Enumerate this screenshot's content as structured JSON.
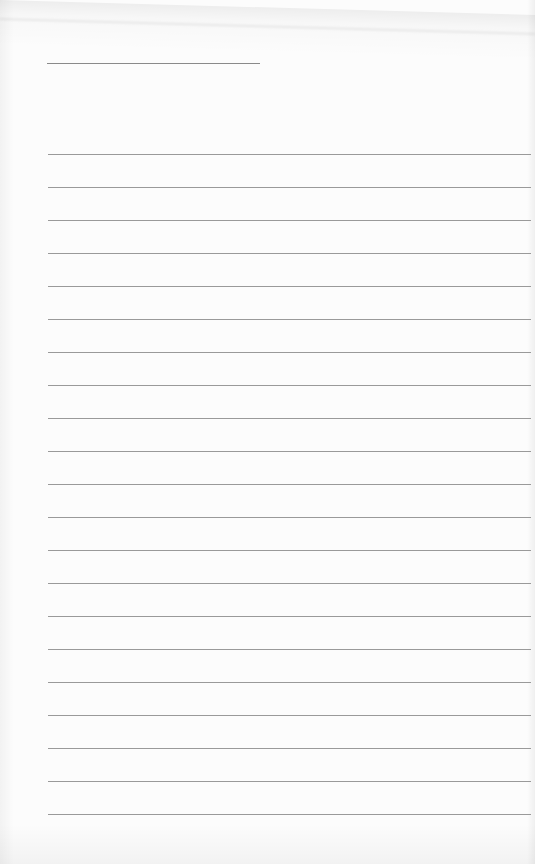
{
  "page": {
    "kind": "lined-paper-sheet",
    "title_line": {
      "filled_text": ""
    },
    "ruled_lines": {
      "count": 21,
      "filled_text": []
    },
    "colors": {
      "paper": "#fcfcfc",
      "rule": "#9a9a9a"
    }
  }
}
